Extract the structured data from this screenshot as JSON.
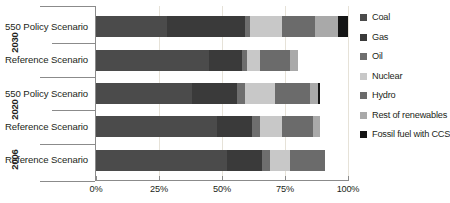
{
  "chart_data": {
    "type": "bar",
    "orientation": "horizontal",
    "stacked": true,
    "normalized": true,
    "title": "",
    "xlabel": "",
    "ylabel": "",
    "xlim": [
      0,
      100
    ],
    "xticks": [
      "0%",
      "25%",
      "50%",
      "75%",
      "100%"
    ],
    "xtick_values": [
      0,
      25,
      50,
      75,
      100
    ],
    "grid": true,
    "legend_position": "right",
    "groups": [
      {
        "year": "2030",
        "categories": [
          "550 Policy Scenario",
          "Reference Scenario"
        ]
      },
      {
        "year": "2020",
        "categories": [
          "550 Policy Scenario",
          "Reference Scenario"
        ]
      },
      {
        "year": "2006",
        "categories": [
          "Reference Scenario"
        ]
      }
    ],
    "categories": [
      "2030 550 Policy Scenario",
      "2030 Reference Scenario",
      "2020 550 Policy Scenario",
      "2020 Reference Scenario",
      "2006 Reference Scenario"
    ],
    "series": [
      {
        "name": "Coal",
        "color": "#4b4b4b",
        "values": [
          28,
          45,
          38,
          48,
          52
        ]
      },
      {
        "name": "Gas",
        "color": "#3a3a3a",
        "values": [
          31,
          13,
          18,
          14,
          14
        ]
      },
      {
        "name": "Oil",
        "color": "#6e6e6e",
        "values": [
          2,
          2,
          3,
          3,
          3
        ]
      },
      {
        "name": "Nuclear",
        "color": "#c8c8c8",
        "values": [
          13,
          5,
          12,
          9,
          8
        ]
      },
      {
        "name": "Hydro",
        "color": "#6b6b6b",
        "values": [
          13,
          12,
          14,
          12,
          14
        ]
      },
      {
        "name": "Rest of renewables",
        "color": "#a9a9a9",
        "values": [
          9,
          3,
          3,
          3,
          0
        ]
      },
      {
        "name": "Fossil fuel with CCS",
        "color": "#151515",
        "values": [
          4,
          0,
          1,
          0,
          0
        ]
      }
    ],
    "legend": [
      {
        "label": "Coal",
        "color": "#4b4b4b"
      },
      {
        "label": "Gas",
        "color": "#3a3a3a"
      },
      {
        "label": "Oil",
        "color": "#6e6e6e"
      },
      {
        "label": "Nuclear",
        "color": "#c8c8c8"
      },
      {
        "label": "Hydro",
        "color": "#6b6b6b"
      },
      {
        "label": "Rest of renewables",
        "color": "#a9a9a9"
      },
      {
        "label": "Fossil fuel with CCS",
        "color": "#151515"
      }
    ]
  },
  "axis": {
    "ticks": [
      {
        "label": "0%",
        "value": 0
      },
      {
        "label": "25%",
        "value": 25
      },
      {
        "label": "50%",
        "value": 50
      },
      {
        "label": "75%",
        "value": 75
      },
      {
        "label": "100%",
        "value": 100
      }
    ]
  },
  "year_labels": [
    {
      "text": "2030"
    },
    {
      "text": "2020"
    },
    {
      "text": "2006"
    }
  ],
  "row_labels": [
    {
      "text": "550 Policy Scenario"
    },
    {
      "text": "Reference Scenario"
    },
    {
      "text": "550 Policy Scenario"
    },
    {
      "text": "Reference Scenario"
    },
    {
      "text": "Reference Scenario"
    }
  ]
}
